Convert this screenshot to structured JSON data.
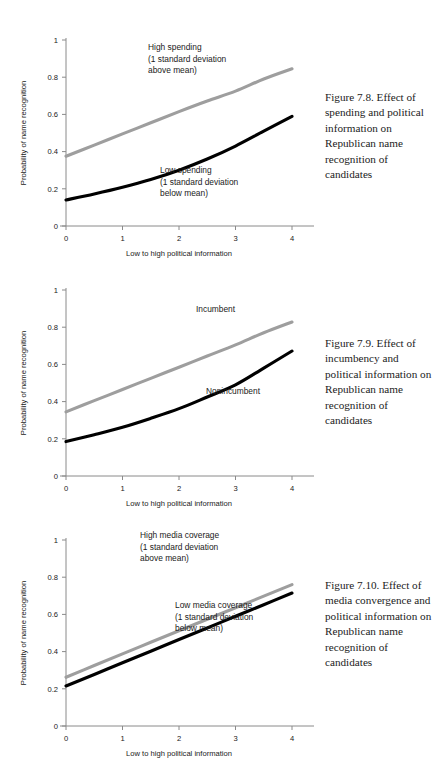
{
  "document": {
    "type": "book-figure-page",
    "figure_count": 3
  },
  "figures": [
    {
      "id": "figure-7-8",
      "caption": "Figure 7.8. Effect of spending and political information on Republican name recognition of candidates",
      "chart_data": {
        "type": "line",
        "title": "",
        "xlabel": "Low to high political information",
        "ylabel": "Probability of name recognition",
        "xlim": [
          0,
          4
        ],
        "ylim": [
          0,
          1
        ],
        "xticks": [
          "0",
          "1",
          "2",
          "3",
          "4"
        ],
        "yticks": [
          "0",
          "0.2",
          "0.4",
          "0.6",
          "0.8",
          "1"
        ],
        "grid": false,
        "legend": "inline-annotations",
        "x": [
          0,
          0.5,
          1,
          1.5,
          2,
          2.5,
          3,
          3.5,
          4
        ],
        "series": [
          {
            "name": "High spending (1 standard deviation above mean)",
            "color": "#9e9e9e",
            "values": [
              0.375,
              0.435,
              0.495,
              0.555,
              0.615,
              0.672,
              0.725,
              0.79,
              0.845
            ]
          },
          {
            "name": "Low spending (1 standard deviation below mean)",
            "color": "#000000",
            "values": [
              0.14,
              0.172,
              0.208,
              0.25,
              0.3,
              0.36,
              0.43,
              0.51,
              0.59
            ]
          }
        ],
        "annotations": [
          {
            "id": "annot-high-spending",
            "lines": [
              "High spending",
              "(1 standard deviation",
              "above mean)"
            ],
            "x_px": 148,
            "y_px": 42
          },
          {
            "id": "annot-low-spending",
            "lines": [
              "Low spending",
              "(1 standard deviation",
              "below mean)"
            ],
            "x_px": 160,
            "y_px": 165
          }
        ]
      }
    },
    {
      "id": "figure-7-9",
      "caption": "Figure 7.9.  Effect of incumbency and political information on Republican name recognition of candidates",
      "chart_data": {
        "type": "line",
        "title": "",
        "xlabel": "Low to high political information",
        "ylabel": "Probability of name recognition",
        "xlim": [
          0,
          4
        ],
        "ylim": [
          0,
          1
        ],
        "xticks": [
          "0",
          "1",
          "2",
          "3",
          "4"
        ],
        "yticks": [
          "0",
          "0.2",
          "0.4",
          "0.6",
          "0.8",
          "1"
        ],
        "grid": false,
        "legend": "inline-annotations",
        "x": [
          0,
          0.5,
          1,
          1.5,
          2,
          2.5,
          3,
          3.5,
          4
        ],
        "series": [
          {
            "name": "Incumbent",
            "color": "#9e9e9e",
            "values": [
              0.345,
              0.405,
              0.465,
              0.525,
              0.585,
              0.645,
              0.705,
              0.77,
              0.828
            ]
          },
          {
            "name": "Nonincumbent",
            "color": "#000000",
            "values": [
              0.185,
              0.222,
              0.262,
              0.31,
              0.362,
              0.425,
              0.49,
              0.58,
              0.672
            ]
          }
        ],
        "annotations": [
          {
            "id": "annot-incumbent",
            "lines": [
              "Incumbent"
            ],
            "x_px": 196,
            "y_px": 54
          },
          {
            "id": "annot-nonincumbent",
            "lines": [
              "Nonincumbent"
            ],
            "x_px": 206,
            "y_px": 136
          }
        ]
      }
    },
    {
      "id": "figure-7-10",
      "caption": "Figure 7.10.  Effect of media convergence and political information on Republican name recognition of candidates",
      "chart_data": {
        "type": "line",
        "title": "",
        "xlabel": "Low to high political information",
        "ylabel": "Probability of name recognition",
        "xlim": [
          0,
          4
        ],
        "ylim": [
          0,
          1
        ],
        "xticks": [
          "0",
          "1",
          "2",
          "3",
          "4"
        ],
        "yticks": [
          "0",
          "0.2",
          "0.4",
          "0.6",
          "0.8",
          "1"
        ],
        "grid": false,
        "legend": "inline-annotations",
        "x": [
          0,
          0.5,
          1,
          1.5,
          2,
          2.5,
          3,
          3.5,
          4
        ],
        "series": [
          {
            "name": "High media coverage (1 standard deviation above mean)",
            "color": "#9e9e9e",
            "values": [
              0.262,
              0.325,
              0.388,
              0.45,
              0.512,
              0.574,
              0.636,
              0.698,
              0.76
            ]
          },
          {
            "name": "Low media coverage (1 standard deviation below mean)",
            "color": "#000000",
            "values": [
              0.215,
              0.277,
              0.34,
              0.402,
              0.465,
              0.527,
              0.59,
              0.652,
              0.715
            ]
          }
        ],
        "annotations": [
          {
            "id": "annot-high-media",
            "lines": [
              "High media coverage",
              "(1 standard deviation",
              "above mean)"
            ],
            "x_px": 140,
            "y_px": 30
          },
          {
            "id": "annot-low-media",
            "lines": [
              "Low media coverage",
              "(1 standard deviation",
              "below mean)"
            ],
            "x_px": 175,
            "y_px": 100
          }
        ]
      }
    }
  ]
}
